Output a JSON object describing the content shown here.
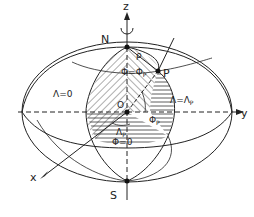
{
  "figure": {
    "colors": {
      "line": "#222222",
      "background": "#ffffff"
    },
    "axes": {
      "z_label": "z",
      "y_label": "y",
      "x_label": "x"
    },
    "points": {
      "north_pole": "N",
      "south_pole": "S",
      "origin": "O",
      "point_p": "P"
    },
    "annotations": {
      "rho": "ρ",
      "latitude_p": "Φ=Φ",
      "latitude_p_sub": "P",
      "meridian_zero": "Λ=0",
      "meridian_p": "Λ=Λ",
      "meridian_p_sub": "P",
      "angle_phi": "Φ",
      "angle_phi_sub": "P",
      "angle_lambda": "Λ",
      "angle_lambda_sub": "P",
      "equator": "Φ=0"
    }
  }
}
